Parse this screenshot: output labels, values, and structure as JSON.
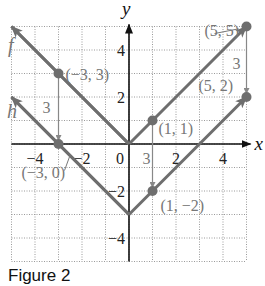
{
  "figure": {
    "caption": "Figure 2"
  },
  "colors": {
    "curve": "#6e6e6e",
    "point": "#6e6e6e",
    "axis": "#111111",
    "grid": "#9a9a9a",
    "label": "#777777",
    "tick": "#222222",
    "arrow": "#888888"
  },
  "chart_data": {
    "type": "line",
    "title": "",
    "xlabel": "x",
    "ylabel": "y",
    "xlim": [
      -5,
      5
    ],
    "ylim": [
      -5,
      5
    ],
    "grid": true,
    "x_ticks": [
      -4,
      -2,
      0,
      2,
      4
    ],
    "y_ticks": [
      4,
      2,
      -2,
      -4
    ],
    "x_tick_labels": [
      "−4",
      "−2",
      "0",
      "2",
      "4"
    ],
    "y_tick_labels": [
      "4",
      "2",
      "−2",
      "−4"
    ],
    "series": [
      {
        "name": "f",
        "label": "f",
        "equation": "y = |x|",
        "x": [
          -5,
          0,
          5
        ],
        "y": [
          5,
          0,
          5
        ]
      },
      {
        "name": "h",
        "label": "h",
        "equation": "y = |x| − 3",
        "x": [
          -5,
          0,
          5
        ],
        "y": [
          2,
          -3,
          2
        ]
      }
    ],
    "points": [
      {
        "x": -3,
        "y": 3,
        "label": "(−3, 3)"
      },
      {
        "x": -3,
        "y": 0,
        "label": "(−3, 0)"
      },
      {
        "x": 1,
        "y": 1,
        "label": "(1, 1)"
      },
      {
        "x": 1,
        "y": -2,
        "label": "(1, −2)"
      },
      {
        "x": 5,
        "y": 5,
        "label": "(5, 5)"
      },
      {
        "x": 5,
        "y": 2,
        "label": "(5, 2)"
      }
    ],
    "annotations": [
      {
        "type": "vertical-shift",
        "from": [
          -3,
          3
        ],
        "to": [
          -3,
          0
        ],
        "label": "3"
      },
      {
        "type": "vertical-shift",
        "from": [
          1,
          1
        ],
        "to": [
          1,
          -2
        ],
        "label": "3"
      },
      {
        "type": "vertical-shift",
        "from": [
          5,
          5
        ],
        "to": [
          5,
          2
        ],
        "label": "3"
      }
    ]
  }
}
